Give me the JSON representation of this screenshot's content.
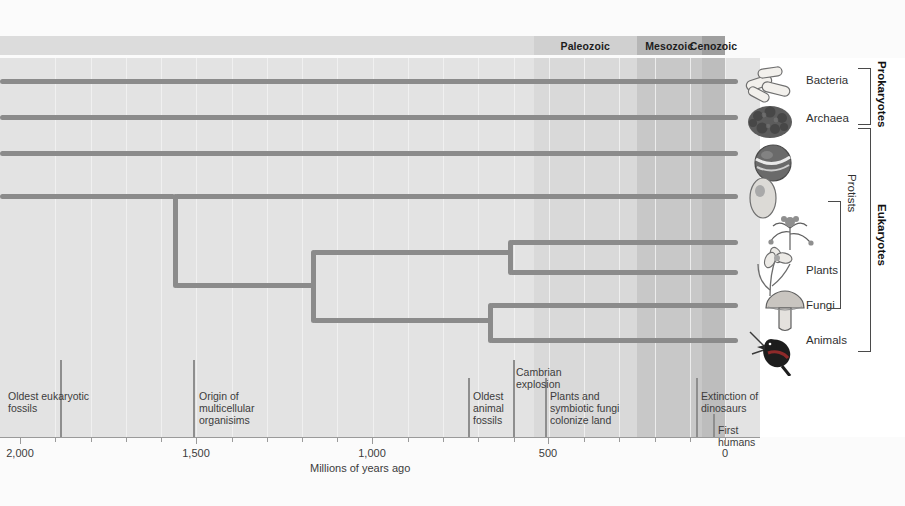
{
  "diagram": {
    "axis": {
      "label": "Millions of years ago",
      "ticks_major": [
        {
          "value": 2000,
          "label": "2,000",
          "x": 20
        },
        {
          "value": 1500,
          "label": "1,500",
          "x": 196
        },
        {
          "value": 1000,
          "label": "1,000",
          "x": 372
        },
        {
          "value": 500,
          "label": "500",
          "x": 548
        },
        {
          "value": 0,
          "label": "0",
          "x": 725
        }
      ],
      "ticks_minor_values": [
        1900,
        1800,
        1700,
        1600,
        1400,
        1300,
        1200,
        1100,
        900,
        800,
        700,
        600,
        400,
        300,
        200,
        100
      ],
      "range": [
        2000,
        0
      ]
    },
    "eras": [
      {
        "name": "",
        "label": "",
        "start": 2000,
        "end": 542,
        "color": "#dcdcdc"
      },
      {
        "name": "paleozoic",
        "label": "Paleozoic",
        "start": 542,
        "end": 251,
        "color": "#d0d0d0"
      },
      {
        "name": "mesozoic",
        "label": "Mesozoic",
        "start": 251,
        "end": 65,
        "color": "#b6b6b6"
      },
      {
        "name": "cenozoic",
        "label": "Cenozoic",
        "start": 65,
        "end": 0,
        "color": "#9f9f9f"
      }
    ],
    "lineages": [
      {
        "name": "Bacteria",
        "label": "Bacteria",
        "y": 81
      },
      {
        "name": "Archaea",
        "label": "Archaea",
        "y": 117
      },
      {
        "name": "Protist-1",
        "label": "",
        "y": 153
      },
      {
        "name": "Protist-2",
        "label": "",
        "y": 196
      },
      {
        "name": "Protist-3",
        "label": "",
        "y": 242
      },
      {
        "name": "Plants",
        "label": "Plants",
        "y": 272
      },
      {
        "name": "Fungi",
        "label": "Fungi",
        "y": 305
      },
      {
        "name": "Animals",
        "label": "Animals",
        "y": 340
      }
    ],
    "taxon_labels": [
      {
        "name": "bacteria",
        "label": "Bacteria",
        "y": 74
      },
      {
        "name": "archaea",
        "label": "Archaea",
        "y": 112
      },
      {
        "name": "protists",
        "label": "Protists",
        "y": 196
      },
      {
        "name": "plants",
        "label": "Plants",
        "y": 264
      },
      {
        "name": "fungi",
        "label": "Fungi",
        "y": 299
      },
      {
        "name": "animals",
        "label": "Animals",
        "y": 334
      }
    ],
    "groups": [
      {
        "name": "prokaryotes",
        "label": "Prokaryotes",
        "top": 68,
        "bottom": 123
      },
      {
        "name": "eukaryotes",
        "label": "Eukaryotes",
        "top": 128,
        "bottom": 350
      }
    ],
    "nodes": [
      {
        "name": "eukaryote-root",
        "x": 175,
        "top": 196,
        "bottom": 285
      },
      {
        "name": "multicellular-node",
        "x": 313,
        "top": 252,
        "bottom": 320
      },
      {
        "name": "plant-protist-node",
        "x": 510,
        "top": 242,
        "bottom": 272
      },
      {
        "name": "fungi-animal-node",
        "x": 490,
        "top": 305,
        "bottom": 340
      }
    ],
    "events": [
      {
        "name": "oldest-eukaryotic-fossils",
        "label": "Oldest eukaryotic\nfossils",
        "x": 60,
        "label_x": 8,
        "label_y": 390,
        "mark_top": 360,
        "mark_bottom": 437
      },
      {
        "name": "origin-multicellular",
        "label": "Origin of\nmulticellular\norganisims",
        "x": 193,
        "label_x": 199,
        "label_y": 390,
        "mark_top": 360,
        "mark_bottom": 437
      },
      {
        "name": "oldest-animal-fossils",
        "label": "Oldest\nanimal\nfossils",
        "x": 468,
        "label_x": 473,
        "label_y": 390,
        "mark_top": 378,
        "mark_bottom": 437
      },
      {
        "name": "cambrian-explosion",
        "label": "Cambrian\nexplosion",
        "x": 513,
        "label_x": 516,
        "label_y": 366,
        "mark_top": 360,
        "mark_bottom": 437
      },
      {
        "name": "plants-fungi-colonize",
        "label": "Plants and\nsymbiotic fungi\ncolonize land",
        "x": 545,
        "label_x": 550,
        "label_y": 390,
        "mark_top": 378,
        "mark_bottom": 437
      },
      {
        "name": "extinction-of-dinosaurs",
        "label": "Extinction of\ndinosaurs",
        "x": 696,
        "label_x": 701,
        "label_y": 390,
        "mark_top": 378,
        "mark_bottom": 437
      },
      {
        "name": "first-humans",
        "label": "First humans",
        "x": 713,
        "label_x": 718,
        "label_y": 424,
        "mark_top": 414,
        "mark_bottom": 437
      }
    ],
    "organisms": [
      {
        "name": "bacteria-rods",
        "y": 62
      },
      {
        "name": "archaea-colony",
        "y": 100
      },
      {
        "name": "protist-ciliate",
        "y": 142
      },
      {
        "name": "protist-amoeba",
        "y": 176
      },
      {
        "name": "protist-alga",
        "y": 212
      },
      {
        "name": "plant-flower",
        "y": 248
      },
      {
        "name": "fungi-mushroom",
        "y": 288
      },
      {
        "name": "animal-bird",
        "y": 320
      }
    ],
    "colors": {
      "branch": "#8b8b8b",
      "plot_bg": "#e3e3e3",
      "era_paleozoic": "#d0d0d0",
      "era_mesozoic": "#b6b6b6",
      "era_cenozoic": "#9f9f9f",
      "text": "#3c3c3c"
    }
  },
  "chart_data": {
    "type": "tree",
    "xlabel": "Millions of years ago",
    "xlim": [
      2000,
      0
    ],
    "tips": [
      "Bacteria",
      "Archaea",
      "Protists",
      "Protists",
      "Protists",
      "Plants",
      "Fungi",
      "Animals"
    ],
    "internal_nodes_mya": [
      1570,
      1180,
      620,
      680
    ],
    "event_markers_mya": [
      1830,
      1570,
      845,
      715,
      620,
      80,
      35
    ],
    "eras": [
      "Paleozoic",
      "Mesozoic",
      "Cenozoic"
    ]
  }
}
